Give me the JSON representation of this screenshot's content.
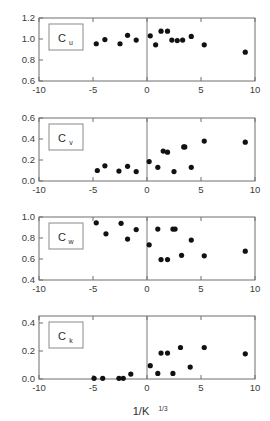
{
  "figure": {
    "xlabel": "1/K",
    "xlabel_sup": "1/3",
    "xlabel_full": "1/K^1/3",
    "x_ticks": [
      "-10",
      "-5",
      "0",
      "5",
      "10"
    ],
    "x_tick_values": [
      -10,
      -5,
      0,
      5,
      10
    ],
    "xlim": [
      -10,
      10
    ]
  },
  "chart_data": [
    {
      "type": "scatter",
      "title": "Cu",
      "label": "C",
      "label_sub": "u",
      "xlabel": "1/K^1/3",
      "ylabel": "",
      "xlim": [
        -10,
        10
      ],
      "ylim": [
        0.6,
        1.2
      ],
      "y_ticks": [
        "0.6",
        "0.8",
        "1.0",
        "1.2"
      ],
      "y_tick_values": [
        0.6,
        0.8,
        1.0,
        1.2
      ],
      "grid": false,
      "zero_line": true,
      "x": [
        -4.7,
        -3.9,
        -2.5,
        -1.8,
        -1.0,
        0.3,
        0.8,
        1.3,
        1.9,
        2.3,
        2.8,
        3.3,
        4.1,
        5.3,
        9.1
      ],
      "y": [
        0.955,
        0.995,
        0.955,
        1.035,
        0.99,
        1.03,
        0.945,
        1.075,
        1.075,
        0.99,
        0.985,
        0.99,
        1.025,
        0.945,
        0.875
      ]
    },
    {
      "type": "scatter",
      "title": "Cv",
      "label": "C",
      "label_sub": "v",
      "xlabel": "1/K^1/3",
      "ylabel": "",
      "xlim": [
        -10,
        10
      ],
      "ylim": [
        0.0,
        0.6
      ],
      "y_ticks": [
        "0.0",
        "0.2",
        "0.4",
        "0.6"
      ],
      "y_tick_values": [
        0.0,
        0.2,
        0.4,
        0.6
      ],
      "grid": false,
      "zero_line": true,
      "x": [
        -4.6,
        -3.9,
        -2.6,
        -1.8,
        -1.0,
        0.2,
        1.0,
        1.5,
        1.9,
        2.5,
        3.4,
        3.5,
        4.1,
        5.3,
        9.1
      ],
      "y": [
        0.1,
        0.145,
        0.095,
        0.14,
        0.09,
        0.185,
        0.13,
        0.285,
        0.275,
        0.09,
        0.325,
        0.325,
        0.13,
        0.38,
        0.37
      ]
    },
    {
      "type": "scatter",
      "title": "Cw",
      "label": "C",
      "label_sub": "w",
      "xlabel": "1/K^1/3",
      "ylabel": "",
      "xlim": [
        -10,
        10
      ],
      "ylim": [
        0.4,
        1.0
      ],
      "y_ticks": [
        "0.4",
        "0.6",
        "0.8",
        "1.0"
      ],
      "y_tick_values": [
        0.4,
        0.6,
        0.8,
        1.0
      ],
      "grid": false,
      "zero_line": true,
      "x": [
        -4.7,
        -3.8,
        -2.4,
        -1.8,
        -1.0,
        0.2,
        1.0,
        1.3,
        1.9,
        2.4,
        2.6,
        3.2,
        4.1,
        5.3,
        9.1
      ],
      "y": [
        0.945,
        0.84,
        0.94,
        0.79,
        0.88,
        0.735,
        0.885,
        0.595,
        0.595,
        0.885,
        0.885,
        0.635,
        0.78,
        0.63,
        0.675
      ]
    },
    {
      "type": "scatter",
      "title": "Ck",
      "label": "C",
      "label_sub": "k",
      "xlabel": "1/K^1/3",
      "ylabel": "",
      "xlim": [
        -10,
        10
      ],
      "ylim": [
        0.0,
        0.45
      ],
      "y_ticks": [
        "0.0",
        "0.2",
        "0.4"
      ],
      "y_tick_values": [
        0.0,
        0.2,
        0.4
      ],
      "grid": false,
      "zero_line": true,
      "x": [
        -4.9,
        -4.1,
        -2.6,
        -2.2,
        -1.5,
        0.3,
        1.0,
        1.3,
        1.9,
        2.4,
        3.1,
        4.0,
        5.3,
        9.1
      ],
      "y": [
        0.005,
        0.005,
        0.005,
        0.005,
        0.035,
        0.095,
        0.04,
        0.185,
        0.185,
        0.04,
        0.225,
        0.085,
        0.225,
        0.18
      ]
    }
  ]
}
